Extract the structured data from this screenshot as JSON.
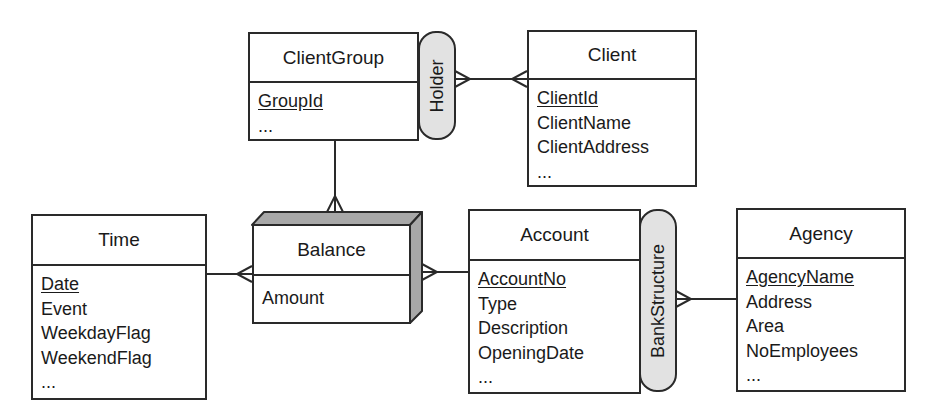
{
  "entities": {
    "clientgroup": {
      "name": "ClientGroup",
      "attributes": [
        {
          "label": "GroupId",
          "key": true
        },
        {
          "label": "...",
          "key": false
        }
      ]
    },
    "client": {
      "name": "Client",
      "attributes": [
        {
          "label": "ClientId",
          "key": true
        },
        {
          "label": "ClientName",
          "key": false
        },
        {
          "label": "ClientAddress",
          "key": false
        },
        {
          "label": "...",
          "key": false
        }
      ]
    },
    "time": {
      "name": "Time",
      "attributes": [
        {
          "label": "Date",
          "key": true
        },
        {
          "label": "Event",
          "key": false
        },
        {
          "label": "WeekdayFlag",
          "key": false
        },
        {
          "label": "WeekendFlag",
          "key": false
        },
        {
          "label": "...",
          "key": false
        }
      ]
    },
    "balance": {
      "name": "Balance",
      "fact": true,
      "attributes": [
        {
          "label": "Amount",
          "key": false
        }
      ]
    },
    "account": {
      "name": "Account",
      "attributes": [
        {
          "label": "AccountNo",
          "key": true
        },
        {
          "label": "Type",
          "key": false
        },
        {
          "label": "Description",
          "key": false
        },
        {
          "label": "OpeningDate",
          "key": false
        },
        {
          "label": "...",
          "key": false
        }
      ]
    },
    "agency": {
      "name": "Agency",
      "attributes": [
        {
          "label": "AgencyName",
          "key": true
        },
        {
          "label": "Address",
          "key": false
        },
        {
          "label": "Area",
          "key": false
        },
        {
          "label": "NoEmployees",
          "key": false
        },
        {
          "label": "...",
          "key": false
        }
      ]
    }
  },
  "hierarchies": {
    "holder": {
      "label": "Holder",
      "parent": "ClientGroup",
      "child": "Client"
    },
    "bankstructure": {
      "label": "BankStructure",
      "parent": "Agency",
      "child": "Account"
    }
  },
  "relationships": [
    {
      "from": "Balance",
      "to": "ClientGroup",
      "cardinality": "many-to-one"
    },
    {
      "from": "Balance",
      "to": "Time",
      "cardinality": "many-to-one"
    },
    {
      "from": "Balance",
      "to": "Account",
      "cardinality": "many-to-one"
    }
  ],
  "colors": {
    "line": "#2a2a2a",
    "pill_fill": "#e2e2e2",
    "fact_shade": "#a8a8a8"
  }
}
